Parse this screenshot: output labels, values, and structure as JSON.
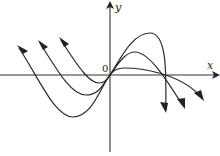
{
  "diagram": {
    "type": "function-graph",
    "axes": {
      "x_label": "x",
      "y_label": "y",
      "origin_label": "0"
    },
    "colors": {
      "stroke": "#2a2a2a",
      "background": "#ffffff"
    },
    "curves": [
      {
        "name": "curve-large",
        "peak": [
          150,
          33
        ],
        "trough": [
          73,
          117
        ],
        "left_tip": [
          19,
          48
        ],
        "right_tip": [
          164,
          110
        ]
      },
      {
        "name": "curve-medium",
        "peak": [
          135,
          52
        ],
        "trough": [
          86,
          95
        ],
        "left_tip": [
          40,
          43
        ],
        "right_tip": [
          183,
          106
        ]
      },
      {
        "name": "curve-small",
        "peak": [
          124,
          68
        ],
        "trough": [
          99,
          83
        ],
        "left_tip": [
          61,
          40
        ],
        "right_tip": [
          202,
          98
        ]
      }
    ]
  }
}
